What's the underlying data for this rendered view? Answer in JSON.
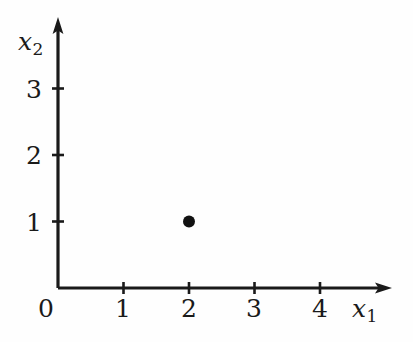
{
  "figure": {
    "background_color": "#fefefe",
    "ink_color": "#1a1a1a",
    "axis_label_x": "x",
    "axis_label_x_sub": "1",
    "axis_label_y": "x",
    "axis_label_y_sub": "2",
    "origin_label": "0"
  },
  "chart_data": {
    "type": "scatter",
    "title": "",
    "xlabel": "x1",
    "ylabel": "x2",
    "xlim": [
      0,
      5.1
    ],
    "ylim": [
      0,
      4.1
    ],
    "grid": false,
    "legend": null,
    "x_ticks": [
      1,
      2,
      3,
      4
    ],
    "x_tick_labels": [
      "1",
      "2",
      "3",
      "4"
    ],
    "y_ticks": [
      1,
      2,
      3
    ],
    "y_tick_labels": [
      "1",
      "2",
      "3"
    ],
    "origin_tick_label": "0",
    "series": [
      {
        "name": "point",
        "marker": "filled-circle",
        "color": "#111111",
        "x": [
          2
        ],
        "y": [
          1
        ],
        "points": [
          {
            "x": 2,
            "y": 1
          }
        ]
      }
    ]
  },
  "geometry": {
    "origin_px": {
      "x": 58,
      "y": 288
    },
    "unit_px_x": 65.5,
    "unit_px_y": 66.5,
    "y_axis_tip_px": 18,
    "x_axis_tip_px": 392,
    "marker_radius_px": 6
  }
}
